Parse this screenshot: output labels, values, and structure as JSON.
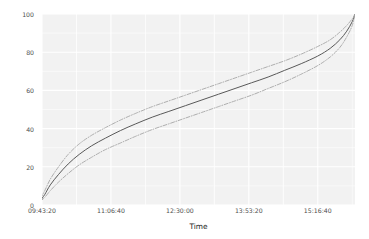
{
  "chart_data": {
    "type": "line",
    "title": "",
    "subtitle": "",
    "xlabel": "Time",
    "ylabel": "% of Order",
    "xlim": [
      35000,
      57700
    ],
    "ylim": [
      0,
      100
    ],
    "grid": true,
    "legend": false,
    "legend_position": "none",
    "panel_background": "#f2f2f2",
    "gridline_color": "#ffffff",
    "xtick_labels": [
      "09:43:20",
      "11:06:40",
      "12:30:00",
      "13:53:20",
      "15:16:40"
    ],
    "xtick_values": [
      35000,
      40000,
      45000,
      50000,
      55000
    ],
    "ytick_labels": [
      "0",
      "20",
      "40",
      "60",
      "80",
      "100"
    ],
    "ytick_values": [
      0,
      20,
      40,
      60,
      80,
      100
    ],
    "x": [
      34900,
      35200,
      35600,
      36200,
      36900,
      37700,
      38600,
      39600,
      40700,
      41800,
      43000,
      44200,
      45400,
      46600,
      47800,
      49000,
      50200,
      51400,
      52600,
      53800,
      55000,
      55900,
      56600,
      57100,
      57500,
      57700
    ],
    "series": [
      {
        "name": "Estimate",
        "style": "solid",
        "color": "#595959",
        "width": 1.0,
        "values": [
          2.5,
          5.5,
          10.5,
          16.0,
          21.5,
          26.5,
          31.0,
          35.0,
          39.0,
          42.5,
          46.0,
          49.0,
          52.0,
          55.0,
          58.0,
          61.0,
          64.0,
          67.0,
          70.5,
          74.0,
          78.0,
          82.0,
          86.5,
          91.0,
          96.0,
          100.0
        ]
      },
      {
        "name": "Upper confidence bound",
        "style": "dashdot",
        "color": "#a6a6a6",
        "width": 0.9,
        "values": [
          3.5,
          7.5,
          13.5,
          20.0,
          26.5,
          32.0,
          36.5,
          40.5,
          44.5,
          48.0,
          51.5,
          54.5,
          57.5,
          60.5,
          63.5,
          66.5,
          69.5,
          72.5,
          75.5,
          79.0,
          83.0,
          86.5,
          90.5,
          94.0,
          97.5,
          100.0
        ]
      },
      {
        "name": "Lower confidence bound",
        "style": "dashdot",
        "color": "#a6a6a6",
        "width": 0.9,
        "values": [
          2.0,
          4.0,
          7.5,
          12.0,
          16.5,
          21.0,
          25.0,
          29.0,
          32.5,
          36.0,
          39.5,
          42.5,
          45.5,
          48.5,
          51.5,
          54.5,
          57.5,
          61.0,
          64.5,
          68.5,
          73.0,
          77.5,
          82.5,
          88.0,
          94.0,
          100.0
        ]
      }
    ]
  }
}
